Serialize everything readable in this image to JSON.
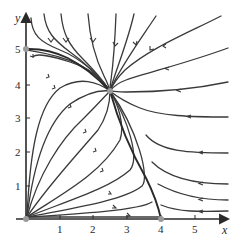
{
  "figure": {
    "type": "phase-portrait",
    "axes": {
      "x_label": "x",
      "y_label": "y",
      "x_ticks": [
        "1",
        "2",
        "3",
        "4",
        "5"
      ],
      "y_ticks": [
        "1",
        "2",
        "3",
        "4",
        "5"
      ],
      "x_range": [
        0,
        5.6
      ],
      "y_range": [
        0,
        5.6
      ]
    },
    "equilibria": [
      {
        "x": 0,
        "y": 0,
        "label": "origin"
      },
      {
        "x": 0,
        "y": 5
      },
      {
        "x": 4,
        "y": 0
      },
      {
        "x": 2.5,
        "y": 3.8
      }
    ],
    "colors": {
      "curve": "#3a3a3a",
      "axis": "#2a2a2a",
      "equilibrium": "#9a9a9a"
    }
  }
}
